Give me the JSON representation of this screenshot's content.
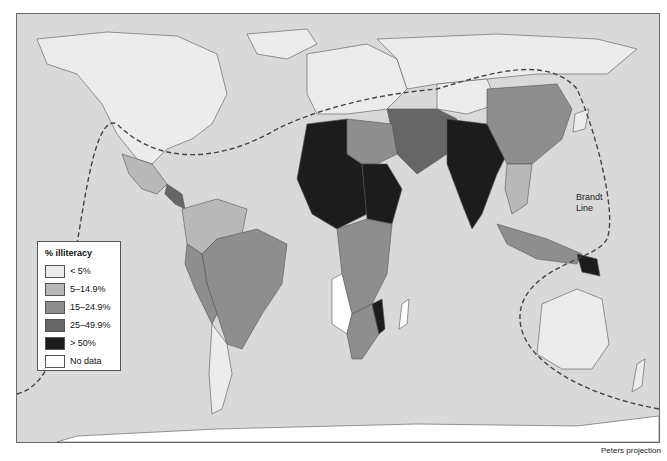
{
  "map": {
    "projection": "Peters projection",
    "line_label": "Brandt\nLine",
    "line_label_lines": [
      "Brandt",
      "Line"
    ],
    "ocean_color": "#d9d9d9"
  },
  "legend": {
    "title": "% illiteracy",
    "items": [
      {
        "label": "< 5%",
        "color": "#ececec"
      },
      {
        "label": "5–14.9%",
        "color": "#b8b8b8"
      },
      {
        "label": "15–24.9%",
        "color": "#8e8e8e"
      },
      {
        "label": "25–49.9%",
        "color": "#666666"
      },
      {
        "label": "> 50%",
        "color": "#1c1c1c"
      },
      {
        "label": "No data",
        "color": "#ffffff"
      }
    ]
  }
}
